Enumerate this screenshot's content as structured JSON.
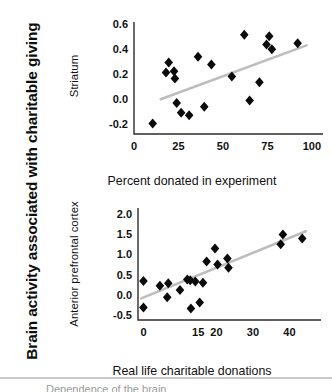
{
  "figure": {
    "super_label": "Brain activity associated with charitable giving",
    "caption_partial": "Dependence of the brain"
  },
  "chart_data": [
    {
      "type": "scatter",
      "id": "striatum",
      "title": "",
      "xlabel": "Percent donated in experiment",
      "ylabel": "Striatum",
      "xlim": [
        0,
        104
      ],
      "ylim": [
        -0.28,
        0.62
      ],
      "xticks": [
        0,
        25,
        50,
        75,
        100
      ],
      "xtick_labels": [
        "0",
        "25",
        "50",
        "75",
        "100"
      ],
      "yticks": [
        -0.2,
        0.0,
        0.2,
        0.4,
        0.6
      ],
      "ytick_labels": [
        "-0.2",
        "0.0",
        "0.2",
        "0.4",
        "0.6"
      ],
      "grid": false,
      "legend": "none",
      "marker": "diamond",
      "marker_color": "#0a0a0a",
      "trend_color": "#bdbdbd",
      "points": [
        {
          "x": 10.5,
          "y": -0.195
        },
        {
          "x": 18.0,
          "y": 0.215
        },
        {
          "x": 19.5,
          "y": 0.295
        },
        {
          "x": 22.5,
          "y": 0.225
        },
        {
          "x": 23.0,
          "y": 0.165
        },
        {
          "x": 24.0,
          "y": -0.03
        },
        {
          "x": 26.5,
          "y": -0.11
        },
        {
          "x": 31.0,
          "y": -0.13
        },
        {
          "x": 36.0,
          "y": 0.34
        },
        {
          "x": 39.5,
          "y": -0.062
        },
        {
          "x": 43.5,
          "y": 0.278
        },
        {
          "x": 55.0,
          "y": 0.183
        },
        {
          "x": 62.0,
          "y": 0.518
        },
        {
          "x": 65.0,
          "y": -0.01
        },
        {
          "x": 70.5,
          "y": 0.135
        },
        {
          "x": 74.5,
          "y": 0.44
        },
        {
          "x": 76.0,
          "y": 0.505
        },
        {
          "x": 77.5,
          "y": 0.402
        },
        {
          "x": 92.0,
          "y": 0.45
        }
      ],
      "trend": {
        "x0": 15.0,
        "y0": 0.0,
        "x1": 97.0,
        "y1": 0.432
      }
    },
    {
      "type": "scatter",
      "id": "anterior-prefrontal-cortex",
      "title": "",
      "xlabel": "Real life charitable donations",
      "ylabel": "Anterior prefrontal cortex",
      "xlim": [
        -1.5,
        47
      ],
      "ylim": [
        -0.62,
        2.15
      ],
      "xticks": [
        0,
        15,
        20,
        30,
        40
      ],
      "xtick_labels": [
        "0",
        "15",
        "20",
        "30",
        "40"
      ],
      "yticks": [
        -0.5,
        0.0,
        0.5,
        1.0,
        1.5,
        2.0
      ],
      "ytick_labels": [
        "-0.5",
        "0.0",
        "0.5",
        "1.0",
        "1.5",
        "2.0"
      ],
      "grid": false,
      "legend": "none",
      "marker": "diamond",
      "marker_color": "#0a0a0a",
      "trend_color": "#bdbdbd",
      "points": [
        {
          "x": 0.0,
          "y": 0.345
        },
        {
          "x": 0.0,
          "y": -0.31
        },
        {
          "x": 4.5,
          "y": 0.225
        },
        {
          "x": 6.8,
          "y": 0.29
        },
        {
          "x": 6.5,
          "y": -0.055
        },
        {
          "x": 10.0,
          "y": 0.12
        },
        {
          "x": 12.0,
          "y": 0.38
        },
        {
          "x": 12.8,
          "y": 0.365
        },
        {
          "x": 13.0,
          "y": -0.335
        },
        {
          "x": 14.2,
          "y": 0.335
        },
        {
          "x": 15.4,
          "y": -0.19
        },
        {
          "x": 16.3,
          "y": 0.3
        },
        {
          "x": 17.3,
          "y": 0.825
        },
        {
          "x": 19.6,
          "y": 1.15
        },
        {
          "x": 20.3,
          "y": 0.755
        },
        {
          "x": 23.0,
          "y": 0.9
        },
        {
          "x": 23.3,
          "y": 0.675
        },
        {
          "x": 37.6,
          "y": 1.255
        },
        {
          "x": 38.2,
          "y": 1.495
        },
        {
          "x": 43.5,
          "y": 1.395
        }
      ],
      "trend": {
        "x0": -0.6,
        "y0": -0.085,
        "x1": 44.5,
        "y1": 1.575
      }
    }
  ]
}
